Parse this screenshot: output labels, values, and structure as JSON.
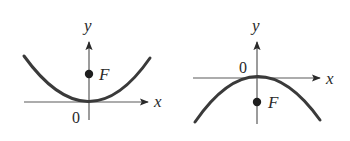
{
  "figures": [
    {
      "id": "upward-parabola",
      "description": "Parabola opening upward with focus F above vertex at origin",
      "x_label": "x",
      "y_label": "y",
      "origin_label": "0",
      "focus_label": "F",
      "opens": "up"
    },
    {
      "id": "downward-parabola",
      "description": "Parabola opening downward with focus F below vertex at origin",
      "x_label": "x",
      "y_label": "y",
      "origin_label": "0",
      "focus_label": "F",
      "opens": "down"
    }
  ],
  "colors": {
    "curve": "#3a3a3a",
    "axis": "#5a5a5a",
    "text": "#2a2a2a",
    "background": "#ffffff"
  }
}
